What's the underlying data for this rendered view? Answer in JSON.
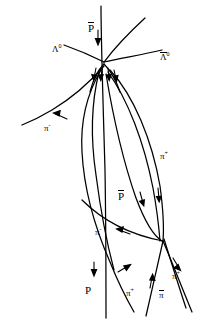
{
  "figure": {
    "background_color": "#ffffff",
    "stroke_color": "#000000",
    "width": 200,
    "height": 322
  },
  "labels": [
    {
      "id": "pbar-top",
      "text": "P",
      "overline": true,
      "superscript": "",
      "x": 88,
      "y": 22,
      "size": "big"
    },
    {
      "id": "lambda0-left",
      "text": "Λ",
      "overline": false,
      "superscript": "0",
      "x": 52,
      "y": 45,
      "size": "small"
    },
    {
      "id": "lambda0bar-right",
      "text": "Λ",
      "overline": true,
      "superscript": "0",
      "x": 160,
      "y": 52,
      "size": "small"
    },
    {
      "id": "pi-minus-left",
      "text": "π",
      "overline": false,
      "superscript": "-",
      "x": 44,
      "y": 124,
      "size": "small"
    },
    {
      "id": "pi-plus-right",
      "text": "π",
      "overline": false,
      "superscript": "+",
      "x": 160,
      "y": 152,
      "size": "small"
    },
    {
      "id": "pbar-mid",
      "text": "P",
      "overline": true,
      "superscript": "",
      "x": 118,
      "y": 190,
      "size": "big"
    },
    {
      "id": "pi-minus-mid",
      "text": "π",
      "overline": false,
      "superscript": "-",
      "x": 95,
      "y": 228,
      "size": "small"
    },
    {
      "id": "proton-bottom",
      "text": "P",
      "overline": false,
      "superscript": "",
      "x": 85,
      "y": 285,
      "size": "big"
    },
    {
      "id": "pi-plus-bottom",
      "text": "π",
      "overline": false,
      "superscript": "+",
      "x": 126,
      "y": 289,
      "size": "small"
    },
    {
      "id": "pi-plus-bottom-right",
      "text": "π",
      "overline": false,
      "superscript": "+",
      "x": 172,
      "y": 272,
      "size": "small"
    },
    {
      "id": "pi-bar-bottom-right",
      "text": "π",
      "overline": true,
      "superscript": "",
      "x": 159,
      "y": 290,
      "size": "small"
    }
  ],
  "particles": {
    "incoming_antiproton": "P-bar",
    "lambda_zero": "Lambda-0",
    "lambda_zero_bar": "Lambda-0-bar",
    "pi_minus": "pi-minus",
    "pi_plus": "pi-plus",
    "proton": "P"
  },
  "vertices": [
    {
      "id": "primary-vertex",
      "x": 104,
      "y": 62
    },
    {
      "id": "secondary-vertex",
      "x": 163,
      "y": 241
    }
  ],
  "colors": {
    "stroke": "#000000",
    "background": "#ffffff"
  }
}
